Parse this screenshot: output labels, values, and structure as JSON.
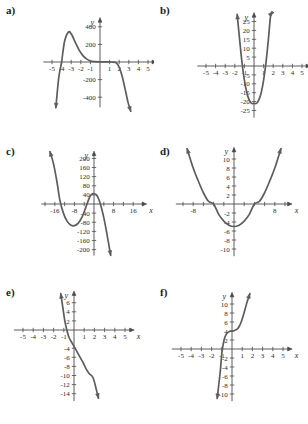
{
  "figure": {
    "background": "#ffffff",
    "curve_color": "#5d5d5d",
    "axis_color": "#4a4a4a",
    "text_color": "#2b2b2b",
    "panel_count": 6
  },
  "panels": [
    {
      "key": "a",
      "label": "a)",
      "axis": {
        "x_name": "x",
        "y_name": "y"
      },
      "x_ticks": [
        "-5",
        "-4",
        "-3",
        "-2",
        "-1",
        "1",
        "2",
        "3",
        "4",
        "5"
      ],
      "y_ticks": [
        "400",
        "200",
        "-200",
        "-400"
      ]
    },
    {
      "key": "b",
      "label": "b)",
      "axis": {
        "x_name": "x",
        "y_name": "y"
      },
      "x_ticks": [
        "-5",
        "-4",
        "-3",
        "-2",
        "-1",
        "1",
        "2",
        "3",
        "4",
        "5"
      ],
      "y_ticks": [
        "25",
        "20",
        "15",
        "10",
        "5",
        "-5",
        "-10",
        "-15",
        "-20",
        "-25"
      ]
    },
    {
      "key": "c",
      "label": "c)",
      "axis": {
        "x_name": "x",
        "y_name": "y"
      },
      "x_ticks": [
        "-16",
        "-8",
        "8",
        "16"
      ],
      "y_ticks": [
        "200",
        "160",
        "120",
        "80",
        "40",
        "-40",
        "-80",
        "-120",
        "-160",
        "-200"
      ]
    },
    {
      "key": "d",
      "label": "d)",
      "axis": {
        "x_name": "x",
        "y_name": "y"
      },
      "x_ticks": [
        "-8",
        "8"
      ],
      "y_ticks": [
        "10",
        "8",
        "6",
        "4",
        "2",
        "-2",
        "-4",
        "-6",
        "-8",
        "-10"
      ]
    },
    {
      "key": "e",
      "label": "e)",
      "axis": {
        "x_name": "x",
        "y_name": "y"
      },
      "x_ticks": [
        "-5",
        "-4",
        "-3",
        "-2",
        "-1",
        "1",
        "2",
        "3",
        "4",
        "5"
      ],
      "y_ticks": [
        "6",
        "4",
        "2",
        "-4",
        "-6",
        "-8",
        "-10",
        "-12",
        "-14"
      ]
    },
    {
      "key": "f",
      "label": "f)",
      "axis": {
        "x_name": "x",
        "y_name": "y"
      },
      "x_ticks": [
        "-5",
        "-4",
        "-3",
        "-2",
        "-1",
        "1",
        "2",
        "3",
        "4",
        "5"
      ],
      "y_ticks": [
        "10",
        "8",
        "6",
        "4",
        "2",
        "-2",
        "-4",
        "-6",
        "-8",
        "-10"
      ]
    }
  ],
  "chart_data": [
    {
      "type": "line",
      "panel": "a",
      "title": "a)",
      "xlabel": "x",
      "ylabel": "y",
      "xlim": [
        -5.8,
        5.8
      ],
      "ylim": [
        -560,
        560
      ],
      "grid": false,
      "legend": "none",
      "description": "Quartic-like curve, negative leading coefficient: rises from below left, crosses near x=-4, local max about 340 near x=-3.3, flattens near zero between x=-1 and x=1, then falls steeply after x=2",
      "x": [
        -4.6,
        -4.3,
        -4.0,
        -3.7,
        -3.3,
        -3.0,
        -2.6,
        -2.2,
        -1.8,
        -1.4,
        -1.0,
        -0.5,
        0.0,
        0.6,
        1.2,
        1.7,
        2.0,
        2.3,
        2.6,
        2.9,
        3.2
      ],
      "y": [
        -520,
        -180,
        0,
        230,
        340,
        320,
        230,
        140,
        75,
        35,
        12,
        4,
        2,
        2,
        0,
        -10,
        -60,
        -160,
        -300,
        -450,
        -560
      ]
    },
    {
      "type": "line",
      "panel": "b",
      "title": "b)",
      "xlabel": "x",
      "ylabel": "y",
      "xlim": [
        -5.8,
        5.8
      ],
      "ylim": [
        -28,
        30
      ],
      "grid": false,
      "legend": "none",
      "description": "Narrow upward parabola, vertex about (0.2, -21), x-intercepts near x=-1.2 and x=1.5",
      "x": [
        -1.75,
        -1.5,
        -1.25,
        -1.0,
        -0.75,
        -0.5,
        -0.25,
        0.0,
        0.25,
        0.5,
        0.75,
        1.0,
        1.25,
        1.5,
        1.75,
        2.0
      ],
      "y": [
        29,
        15,
        2,
        -8,
        -15,
        -19,
        -21,
        -21,
        -21,
        -19,
        -15,
        -8,
        2,
        15,
        29,
        30
      ]
    },
    {
      "type": "line",
      "panel": "c",
      "title": "c)",
      "xlabel": "x",
      "ylabel": "y",
      "xlim": [
        -22,
        22
      ],
      "ylim": [
        -230,
        230
      ],
      "grid": false,
      "legend": "none",
      "description": "Cubic with negative leading coefficient: falls from upper left, crosses near x=-14, local min about -95 near x=-8, local max about 45 near x=-1, crosses near x=4 and descends",
      "x": [
        -18,
        -16.5,
        -15,
        -14,
        -12.5,
        -11,
        -9.5,
        -8,
        -6.5,
        -5,
        -3.5,
        -2,
        -1,
        0,
        1,
        2,
        3,
        4,
        5,
        6,
        6.8
      ],
      "y": [
        230,
        175,
        90,
        20,
        -40,
        -75,
        -92,
        -95,
        -85,
        -60,
        -20,
        25,
        42,
        45,
        40,
        20,
        -15,
        -60,
        -115,
        -175,
        -225
      ]
    },
    {
      "type": "line",
      "panel": "d",
      "title": "d)",
      "xlabel": "x",
      "ylabel": "y",
      "xlim": [
        -11.5,
        11.5
      ],
      "ylim": [
        -11.5,
        12.5
      ],
      "grid": false,
      "legend": "none",
      "description": "Upward parabola with vertex about (0, -5) and x-intercepts near x=-4 and x=4",
      "x": [
        -9.2,
        -8,
        -7,
        -6,
        -5,
        -4,
        -3,
        -2,
        -1,
        0,
        1,
        2,
        3,
        4,
        5,
        6,
        7,
        8,
        9.2
      ],
      "y": [
        12.3,
        8.0,
        5.1,
        2.5,
        0.6,
        0.0,
        -2.3,
        -3.8,
        -4.7,
        -5.0,
        -4.7,
        -3.8,
        -2.3,
        0.0,
        0.6,
        2.5,
        5.1,
        8.0,
        12.3
      ]
    },
    {
      "type": "line",
      "panel": "e",
      "title": "e)",
      "xlabel": "x",
      "ylabel": "y",
      "xlim": [
        -5.8,
        5.8
      ],
      "ylim": [
        -15.5,
        8.5
      ],
      "grid": false,
      "legend": "none",
      "description": "Decreasing cubic: steeply descending from upper left, crosses x-axis near x=-0.7, passes through about (0,-3), flattens near x=1.6 at about y=-10, then descends again",
      "x": [
        -1.3,
        -1.1,
        -0.9,
        -0.7,
        -0.5,
        -0.2,
        0.0,
        0.3,
        0.6,
        0.9,
        1.2,
        1.5,
        1.8,
        2.0,
        2.2,
        2.4
      ],
      "y": [
        8.0,
        5.0,
        2.0,
        0.0,
        -1.6,
        -2.8,
        -3.6,
        -4.8,
        -6.0,
        -7.2,
        -8.6,
        -9.6,
        -10.2,
        -11.4,
        -13.2,
        -15.0
      ]
    },
    {
      "type": "line",
      "panel": "f",
      "title": "f)",
      "xlabel": "x",
      "ylabel": "y",
      "xlim": [
        -5.8,
        5.8
      ],
      "ylim": [
        -11.5,
        12.5
      ],
      "grid": false,
      "legend": "none",
      "description": "Increasing cubic with a flat inflection near (0, 4): rises steeply from below, crosses x-axis near x=-1, levels off around y=4 from x=-0.2 to x=0.5, then rises steeply",
      "x": [
        -1.45,
        -1.3,
        -1.15,
        -1.0,
        -0.85,
        -0.7,
        -0.5,
        -0.25,
        0.0,
        0.25,
        0.5,
        0.7,
        0.9,
        1.1,
        1.3,
        1.5,
        1.75
      ],
      "y": [
        -11.0,
        -8.0,
        -5.0,
        -1.0,
        1.2,
        2.6,
        3.5,
        3.9,
        4.0,
        4.1,
        4.4,
        5.0,
        6.0,
        7.4,
        9.0,
        10.6,
        12.3
      ]
    }
  ]
}
